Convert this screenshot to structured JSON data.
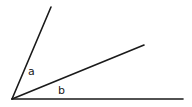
{
  "diagram": {
    "type": "angle-diagram",
    "vertex": {
      "x": 12,
      "y": 99
    },
    "rays": [
      {
        "name": "steep-ray",
        "x2": 51,
        "y2": 7
      },
      {
        "name": "middle-ray",
        "x2": 144,
        "y2": 45
      },
      {
        "name": "horizontal-ray",
        "x2": 183,
        "y2": 99
      }
    ],
    "labels": {
      "a": "a",
      "b": "b"
    },
    "colors": {
      "line": "#1a1a1a",
      "background": "#ffffff"
    }
  }
}
